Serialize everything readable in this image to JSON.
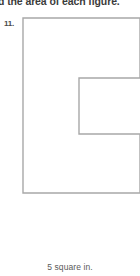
{
  "page": {
    "background_color": "#ffffff",
    "width": 140,
    "height": 276
  },
  "instruction": {
    "text": "d the area of each figure.",
    "full_text_inferred": "Find the area of each figure.",
    "color": "#3b3b3b",
    "clipped": "top"
  },
  "problem": {
    "number_label": "11."
  },
  "figure": {
    "name": "c-shaped-polygon",
    "stroke_color": "#a8a8a8",
    "fill_color": "#ffffff",
    "stroke_width": 1.4,
    "clipped_edge": "right",
    "outline_points": "23,18 140,18 140,78 79,78 79,134 140,134 140,193 23,193",
    "vertices": [
      {
        "x": 23,
        "y": 18
      },
      {
        "x": 140,
        "y": 18
      },
      {
        "x": 140,
        "y": 78
      },
      {
        "x": 79,
        "y": 78
      },
      {
        "x": 79,
        "y": 134
      },
      {
        "x": 140,
        "y": 134
      },
      {
        "x": 140,
        "y": 193
      },
      {
        "x": 23,
        "y": 193
      }
    ]
  },
  "answer": {
    "text": "5 square in.",
    "value": 5,
    "unit": "square in.",
    "color": "#5a5a5a"
  }
}
